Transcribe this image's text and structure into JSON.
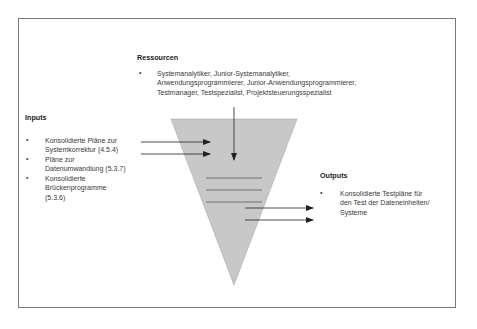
{
  "diagram": {
    "ressourcen": {
      "heading": "Ressourcen",
      "items": [
        {
          "bullet": "•",
          "lines": [
            "Systemanalytiker, Junior-Systemanalytiker,",
            "Anwendungsprogrammierer, Junior-Anwendungsprogrammierer,",
            "Testmanager, Testspezialist, Projektsteuerungsspezialist"
          ]
        }
      ]
    },
    "inputs": {
      "heading": "Inputs",
      "items": [
        {
          "bullet": "•",
          "lines": [
            "Konsolidierte Pläne zur",
            "Systemkorrektur (4.5.4)"
          ]
        },
        {
          "bullet": "•",
          "lines": [
            "Pläne zur",
            "Datenumwandlung (5.3.7)"
          ]
        },
        {
          "bullet": "•",
          "lines": [
            "Konsolidierte",
            "Brückenprogramme",
            "(5.3.6)"
          ]
        }
      ]
    },
    "outputs": {
      "heading": "Outputs",
      "items": [
        {
          "bullet": "•",
          "lines": [
            "Konsolidierte Testpläne für",
            "den Test der Dateneinheiten/",
            "Systeme"
          ]
        }
      ]
    },
    "colors": {
      "funnel_fill": "#c8c8c8",
      "funnel_stroke": "#9a9a9a",
      "arrow": "#222222",
      "frame": "#7a7a7a"
    }
  }
}
